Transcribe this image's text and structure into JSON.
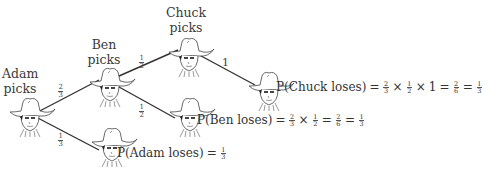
{
  "nodes": {
    "adam": {
      "label_line1": "Adam",
      "label_line2": "picks"
    },
    "ben": {
      "label_line1": "Ben",
      "label_line2": "picks"
    },
    "chuck": {
      "label_line1": "Chuck",
      "label_line2": "picks"
    }
  },
  "branches": {
    "adam_to_ben": {
      "num": "2",
      "den": "3"
    },
    "adam_to_adam_loses": {
      "num": "1",
      "den": "3"
    },
    "ben_to_chuck": {
      "num": "1",
      "den": "2"
    },
    "ben_to_ben_loses": {
      "num": "1",
      "den": "2"
    },
    "chuck_to_chuck_loses": {
      "value": "1"
    }
  },
  "outcomes": {
    "chuck_loses": {
      "lhs": "P(Chuck loses)",
      "eq": "=",
      "times": "×",
      "f1": {
        "num": "2",
        "den": "3"
      },
      "f2": {
        "num": "1",
        "den": "2"
      },
      "mult3": "1",
      "f3": {
        "num": "2",
        "den": "6"
      },
      "f4": {
        "num": "1",
        "den": "3"
      }
    },
    "ben_loses": {
      "lhs": "P(Ben loses)",
      "eq": "=",
      "times": "×",
      "f1": {
        "num": "2",
        "den": "3"
      },
      "f2": {
        "num": "1",
        "den": "2"
      },
      "f3": {
        "num": "2",
        "den": "6"
      },
      "f4": {
        "num": "1",
        "den": "3"
      }
    },
    "adam_loses": {
      "lhs": "P(Adam loses)",
      "eq": "=",
      "f1": {
        "num": "1",
        "den": "3"
      }
    }
  }
}
